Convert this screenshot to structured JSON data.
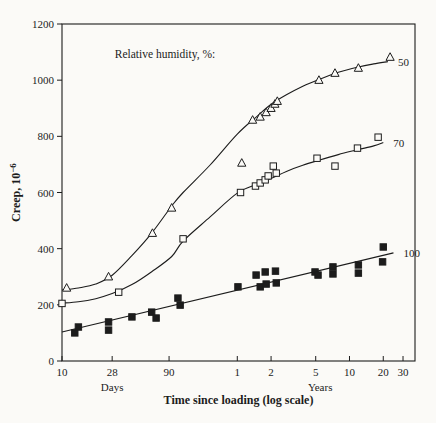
{
  "chart_data": {
    "type": "scatter",
    "annotation": "Relative humidity, %:",
    "xlabel": "Time since loading (log scale)",
    "ylabel": "Creep, 10⁻⁶",
    "ylabel_base": "Creep, 10",
    "ylabel_exponent": "−6",
    "x_log": true,
    "xlim_days": [
      10,
      14500
    ],
    "ylim": [
      0,
      1200
    ],
    "grid": false,
    "y_ticks": [
      0,
      200,
      400,
      600,
      800,
      1000,
      1200
    ],
    "x_ticks_days": [
      {
        "label": "10",
        "days": 10
      },
      {
        "label": "28",
        "days": 28
      },
      {
        "label": "90",
        "days": 90
      }
    ],
    "x_ticks_years": [
      {
        "label": "1",
        "days": 365
      },
      {
        "label": "2",
        "days": 730
      },
      {
        "label": "5",
        "days": 1825
      },
      {
        "label": "10",
        "days": 3650
      },
      {
        "label": "20",
        "days": 7300
      },
      {
        "label": "30",
        "days": 10950
      }
    ],
    "x_unit_labels": [
      {
        "label": "Days",
        "anchor_days": 28
      },
      {
        "label": "Years",
        "anchor_days": 2000
      }
    ],
    "series": [
      {
        "name": "Relative humidity 50%",
        "label": "50",
        "marker": "open-triangle",
        "points_days_creep": [
          [
            11,
            260
          ],
          [
            26,
            300
          ],
          [
            64,
            455
          ],
          [
            95,
            545
          ],
          [
            400,
            705
          ],
          [
            500,
            858
          ],
          [
            584,
            869
          ],
          [
            660,
            885
          ],
          [
            730,
            900
          ],
          [
            790,
            915
          ],
          [
            830,
            925
          ],
          [
            1950,
            1000
          ],
          [
            2710,
            1025
          ],
          [
            4380,
            1043
          ],
          [
            8400,
            1082
          ]
        ],
        "curve": [
          [
            10,
            253
          ],
          [
            14,
            260
          ],
          [
            20,
            274
          ],
          [
            28,
            305
          ],
          [
            42,
            375
          ],
          [
            63,
            455
          ],
          [
            95,
            552
          ],
          [
            120,
            600
          ],
          [
            209,
            698
          ],
          [
            365,
            808
          ],
          [
            550,
            872
          ],
          [
            730,
            914
          ],
          [
            1000,
            948
          ],
          [
            1400,
            978
          ],
          [
            1950,
            1002
          ],
          [
            2900,
            1028
          ],
          [
            4380,
            1047
          ],
          [
            6000,
            1058
          ],
          [
            8030,
            1066
          ]
        ]
      },
      {
        "name": "Relative humidity 70%",
        "label": "70",
        "marker": "open-square",
        "points_days_creep": [
          [
            10,
            205
          ],
          [
            32,
            245
          ],
          [
            120,
            435
          ],
          [
            390,
            600
          ],
          [
            530,
            623
          ],
          [
            584,
            634
          ],
          [
            647,
            645
          ],
          [
            688,
            659
          ],
          [
            764,
            694
          ],
          [
            812,
            669
          ],
          [
            1875,
            722
          ],
          [
            2710,
            694
          ],
          [
            4300,
            758
          ],
          [
            6570,
            797
          ]
        ],
        "curve": [
          [
            10,
            206
          ],
          [
            14,
            211
          ],
          [
            20,
            222
          ],
          [
            28,
            240
          ],
          [
            42,
            272
          ],
          [
            63,
            318
          ],
          [
            95,
            372
          ],
          [
            120,
            427
          ],
          [
            209,
            513
          ],
          [
            365,
            598
          ],
          [
            550,
            630
          ],
          [
            730,
            650
          ],
          [
            1000,
            675
          ],
          [
            1400,
            697
          ],
          [
            1950,
            715
          ],
          [
            2900,
            735
          ],
          [
            4380,
            753
          ],
          [
            6000,
            766
          ],
          [
            7300,
            778
          ]
        ]
      },
      {
        "name": "Relative humidity 100%",
        "label": "100",
        "marker": "filled-square",
        "points_days_creep": [
          [
            13,
            100
          ],
          [
            14,
            121
          ],
          [
            26,
            139
          ],
          [
            26,
            110
          ],
          [
            42,
            157
          ],
          [
            63,
            174
          ],
          [
            69,
            153
          ],
          [
            108,
            224
          ],
          [
            113,
            199
          ],
          [
            370,
            264
          ],
          [
            537,
            306
          ],
          [
            584,
            264
          ],
          [
            647,
            317
          ],
          [
            660,
            274
          ],
          [
            799,
            320
          ],
          [
            812,
            278
          ],
          [
            1800,
            317
          ],
          [
            1914,
            306
          ],
          [
            2600,
            335
          ],
          [
            2600,
            310
          ],
          [
            4380,
            342
          ],
          [
            4380,
            313
          ],
          [
            7300,
            406
          ],
          [
            7200,
            353
          ]
        ],
        "curve": [
          [
            10,
            103
          ],
          [
            9000,
            385
          ]
        ]
      }
    ],
    "colors": {
      "ink": "#1c1c1c",
      "background": "#fbfaf7"
    }
  }
}
